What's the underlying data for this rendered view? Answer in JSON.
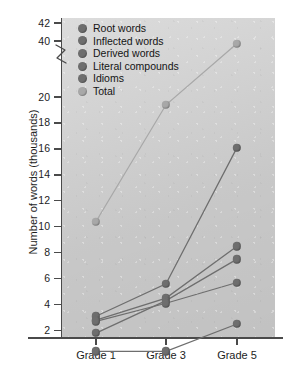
{
  "chart_data": {
    "type": "line",
    "title": "",
    "xlabel": "",
    "ylabel": "Number of words (thousands)",
    "categories": [
      "Grade 1",
      "Grade 3",
      "Grade 5"
    ],
    "x": [
      1,
      3,
      5
    ],
    "ytick_labels": [
      "2",
      "4",
      "6",
      "8",
      "10",
      "12",
      "14",
      "16",
      "18",
      "20",
      "40",
      "42"
    ],
    "ytick_values": [
      2,
      4,
      6,
      8,
      10,
      12,
      14,
      16,
      18,
      20,
      40,
      42
    ],
    "ylim": [
      0,
      42
    ],
    "axis_break": true,
    "axis_break_note": "Y axis is broken between 20 and 40",
    "grid": false,
    "legend_position": "upper left",
    "series": [
      {
        "name": "Root words",
        "values": [
          3.1,
          5.6,
          16.1
        ],
        "color": "#6e6e6e"
      },
      {
        "name": "Inflected words",
        "values": [
          2.8,
          4.5,
          8.5
        ],
        "color": "#6e6e6e"
      },
      {
        "name": "Derived words",
        "values": [
          1.8,
          4.3,
          7.5
        ],
        "color": "#6e6e6e"
      },
      {
        "name": "Literal compounds",
        "values": [
          2.7,
          4.1,
          5.7
        ],
        "color": "#6e6e6e"
      },
      {
        "name": "Idioms",
        "values": [
          0.4,
          0.4,
          2.5
        ],
        "color": "#6e6e6e"
      },
      {
        "name": "Total",
        "values": [
          10.4,
          19.4,
          39.5
        ],
        "color": "#a8a8a8"
      }
    ]
  },
  "style": {
    "plot_background": "#d2d2d2",
    "page_background": "#ffffff",
    "axis_color": "#4a4a4a",
    "text_color": "#1d1d1d"
  }
}
